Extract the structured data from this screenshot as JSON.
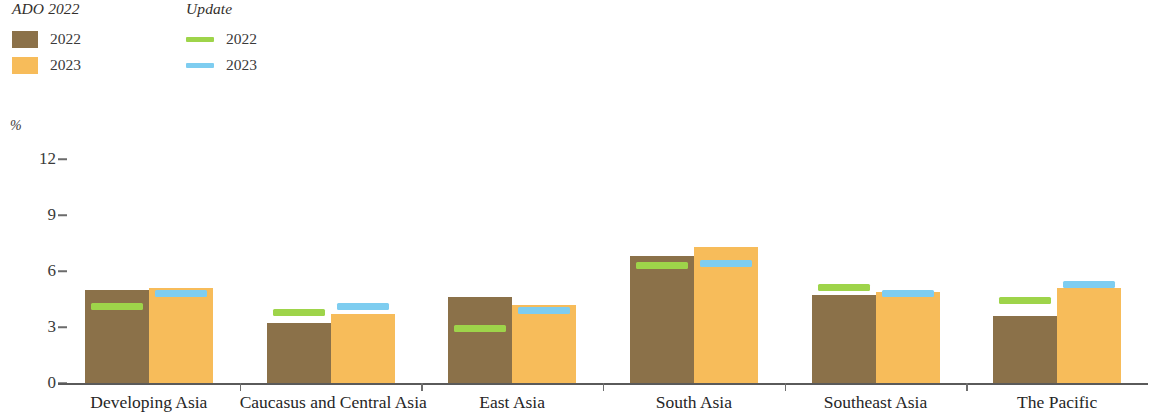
{
  "legend": {
    "groups": [
      {
        "title": "ADO 2022",
        "type": "swatch",
        "items": [
          {
            "label": "2022",
            "color": "#8b7149"
          },
          {
            "label": "2023",
            "color": "#f6b košt"
          }
        ]
      }
    ],
    "ado": {
      "title": "ADO 2022",
      "items": [
        {
          "label": "2022",
          "color": "#8b7149"
        },
        {
          "label": "2023",
          "color": "#f7bc5a"
        }
      ]
    },
    "update": {
      "title": "Update",
      "items": [
        {
          "label": "2022",
          "color": "#9ed44a"
        },
        {
          "label": "2023",
          "color": "#7ecdf0"
        }
      ]
    }
  },
  "chart_data": {
    "type": "bar",
    "title": "",
    "xlabel": "",
    "ylabel": "%",
    "ylim": [
      0,
      12
    ],
    "yticks": [
      0,
      3,
      6,
      9,
      12
    ],
    "grid": false,
    "legend_position": "top-left",
    "categories": [
      "Developing Asia",
      "Caucasus and Central Asia",
      "East Asia",
      "South Asia",
      "Southeast Asia",
      "The Pacific"
    ],
    "series": [
      {
        "name": "ADO 2022 2022",
        "kind": "bar",
        "color": "#8b7149",
        "values": [
          5.0,
          3.2,
          4.6,
          6.8,
          4.7,
          3.6
        ]
      },
      {
        "name": "ADO 2022 2023",
        "kind": "bar",
        "color": "#f7bc5a",
        "values": [
          5.1,
          3.7,
          4.2,
          7.3,
          4.9,
          5.1
        ]
      },
      {
        "name": "Update 2022",
        "kind": "marker",
        "color": "#9ed44a",
        "values": [
          4.1,
          3.8,
          2.9,
          6.3,
          5.1,
          4.4
        ]
      },
      {
        "name": "Update 2023",
        "kind": "marker",
        "color": "#7ecdf0",
        "values": [
          4.8,
          4.1,
          3.9,
          6.4,
          4.8,
          5.3
        ]
      }
    ]
  }
}
